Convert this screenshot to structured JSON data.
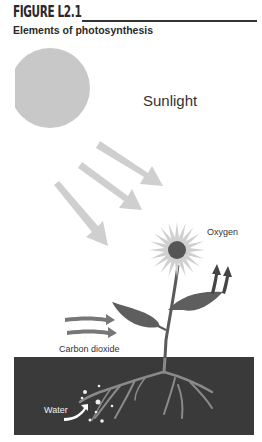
{
  "figure": {
    "number_label": "FIGURE L2.1",
    "title": "Elements of photosynthesis"
  },
  "labels": {
    "sunlight": "Sunlight",
    "oxygen": "Oxygen",
    "carbon_dioxide": "Carbon dioxide",
    "water": "Water"
  },
  "colors": {
    "sun": "#c8c8c8",
    "sun_rays": "#cfcfcf",
    "flower_petals": "#d0d0d0",
    "flower_center": "#555555",
    "leaves": "#5e5e5e",
    "stem": "#5a5a5a",
    "soil": "#3a3a3a",
    "roots": "#8a8a8a",
    "oxygen_arrows": "#444444",
    "co2_arrows": "#777777",
    "water_arrow": "#ffffff"
  }
}
